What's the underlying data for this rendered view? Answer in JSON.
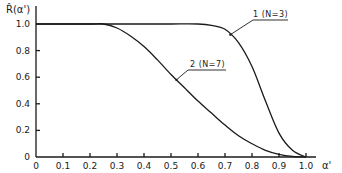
{
  "chart_data": {
    "type": "line",
    "title": "",
    "xlabel": "α'",
    "ylabel": "R̂(α')",
    "xlim": [
      0,
      1.0
    ],
    "ylim": [
      0,
      1.0
    ],
    "grid": false,
    "x_ticks": [
      "0",
      "0.1",
      "0.2",
      "0.3",
      "0.4",
      "0.5",
      "0.6",
      "0.7",
      "0.8",
      "0.9",
      "1.0"
    ],
    "y_ticks": [
      "0",
      "0.2",
      "0.4",
      "0.6",
      "0.8",
      "1.0"
    ],
    "series": [
      {
        "name": "1 (N=3)",
        "x": [
          0,
          0.1,
          0.2,
          0.3,
          0.4,
          0.5,
          0.6,
          0.65,
          0.7,
          0.75,
          0.8,
          0.85,
          0.9,
          0.95,
          1.0
        ],
        "y": [
          1.0,
          1.0,
          1.0,
          1.0,
          1.0,
          1.0,
          1.0,
          0.99,
          0.96,
          0.86,
          0.68,
          0.42,
          0.18,
          0.05,
          0.0
        ]
      },
      {
        "name": "2 (N=7)",
        "x": [
          0,
          0.1,
          0.2,
          0.25,
          0.3,
          0.35,
          0.4,
          0.45,
          0.5,
          0.55,
          0.6,
          0.65,
          0.7,
          0.75,
          0.8,
          0.85,
          0.9,
          0.95,
          1.0
        ],
        "y": [
          1.0,
          1.0,
          1.0,
          1.0,
          0.97,
          0.91,
          0.83,
          0.73,
          0.62,
          0.52,
          0.42,
          0.33,
          0.24,
          0.16,
          0.1,
          0.05,
          0.02,
          0.005,
          0.0
        ]
      }
    ],
    "annotations": [
      {
        "text": "1 (N=3)",
        "series": 0
      },
      {
        "text": "2 (N=7)",
        "series": 1
      }
    ],
    "legend_position": "inline-annotations"
  },
  "axes": {
    "ylabel": "R̂(α')",
    "xlabel": "α'"
  }
}
